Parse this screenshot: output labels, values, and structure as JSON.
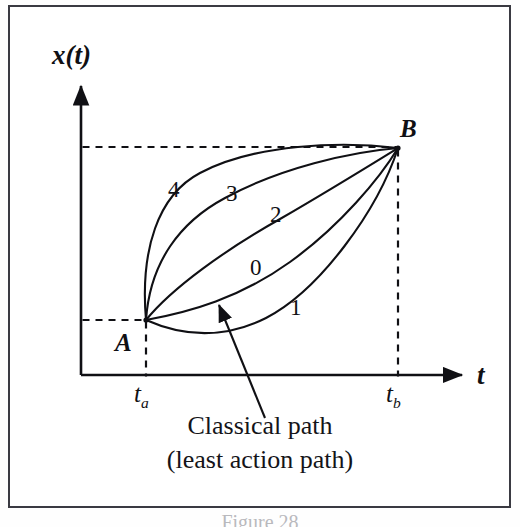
{
  "figure": {
    "domain": "Diagram",
    "background_color": "#ffffff",
    "frame_color": "#3a3a42",
    "ink_color": "#101014",
    "caption_line_1": "Classical path",
    "caption_line_2": "(least action path)",
    "figure_number": "Figure 28"
  },
  "axes": {
    "y_label": "x(t)",
    "x_label": "t",
    "x_tick_a": "t",
    "x_tick_a_sub": "a",
    "x_tick_b": "t",
    "x_tick_b_sub": "b",
    "origin_px": {
      "x": 81,
      "y": 375
    },
    "y_axis_top_px": 82,
    "x_axis_right_px": 466
  },
  "points": [
    {
      "name": "A",
      "label": "A",
      "x_px": 146,
      "y_px": 320,
      "tick": "t_a"
    },
    {
      "name": "B",
      "label": "B",
      "x_px": 398,
      "y_px": 148,
      "tick": "t_b"
    }
  ],
  "guides": [
    {
      "name": "horizontal-guide-A",
      "type": "dashed",
      "from": [
        81,
        320
      ],
      "to": [
        146,
        320
      ]
    },
    {
      "name": "horizontal-guide-B",
      "type": "dashed",
      "from": [
        81,
        147
      ],
      "to": [
        398,
        147
      ]
    },
    {
      "name": "vertical-guide-ta",
      "type": "dashed",
      "from": [
        146,
        320
      ],
      "to": [
        146,
        378
      ]
    },
    {
      "name": "vertical-guide-tb",
      "type": "dashed",
      "from": [
        398,
        148
      ],
      "to": [
        398,
        378
      ]
    }
  ],
  "paths": [
    {
      "id": "4",
      "label": "4",
      "label_px": {
        "x": 175,
        "y": 190
      },
      "description": "uppermost path, bows high and left",
      "d": "M 146 320 C 140 250 158 195 200 173 C 255 144 340 141 398 148"
    },
    {
      "id": "3",
      "label": "3",
      "label_px": {
        "x": 232,
        "y": 194
      },
      "description": "second path from top",
      "d": "M 146 320 C 150 262 180 222 225 198 C 280 168 350 152 398 148"
    },
    {
      "id": "2",
      "label": "2",
      "label_px": {
        "x": 276,
        "y": 214
      },
      "description": "middle path",
      "d": "M 146 320 C 172 288 225 250 280 219 C 330 190 372 164 398 148"
    },
    {
      "id": "0",
      "label": "0",
      "label_px": {
        "x": 256,
        "y": 267
      },
      "description": "classical path, least action path",
      "d": "M 146 320 C 190 312 240 298 290 262 C 340 226 380 178 398 148"
    },
    {
      "id": "1",
      "label": "1",
      "label_px": {
        "x": 295,
        "y": 308
      },
      "description": "lowest path, dips below A",
      "d": "M 146 320 C 182 336 222 340 266 318 C 320 290 378 210 398 148"
    }
  ],
  "annotation": {
    "name": "classical-path-pointer",
    "arrow_from": [
      265,
      418
    ],
    "arrow_to": [
      217,
      302
    ],
    "target_path_id": "0"
  }
}
